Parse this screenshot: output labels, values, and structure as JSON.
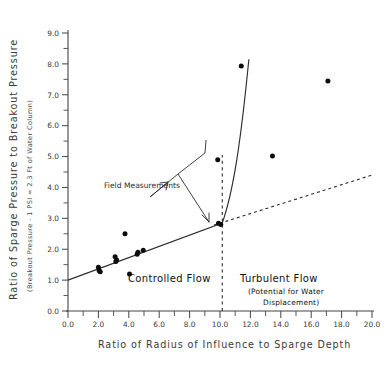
{
  "chart_data": {
    "type": "scatter",
    "title": "",
    "xlabel": "Ratio of Radius of Influence to Sparge Depth",
    "ylabel": "Ratio of Sparge Pressure to Breakout Pressure",
    "ylabel_sub": "(Breakout Pressure - 1 PSI = 2.3 Ft of Water Column)",
    "xlim": [
      0.0,
      20.0
    ],
    "ylim": [
      0.0,
      9.0
    ],
    "xticks": [
      "0.0",
      "2.0",
      "4.0",
      "6.0",
      "8.0",
      "10.0",
      "12.0",
      "14.0",
      "16.0",
      "18.0",
      "20.0"
    ],
    "xtick_values": [
      0,
      2,
      4,
      6,
      8,
      10,
      12,
      14,
      16,
      18,
      20
    ],
    "xtick_minor_step": 1.0,
    "yticks": [
      "0.0",
      "1.0",
      "2.0",
      "3.0",
      "4.0",
      "5.0",
      "6.0",
      "7.0",
      "8.0",
      "9.0"
    ],
    "ytick_values": [
      0,
      1,
      2,
      3,
      4,
      5,
      6,
      7,
      8,
      9
    ],
    "ytick_minor_step": 0.5,
    "grid": false,
    "legend": "none",
    "series": [
      {
        "name": "Field Measurements",
        "marker": "filled-circle",
        "points": [
          {
            "x": 2.0,
            "y": 1.42
          },
          {
            "x": 2.05,
            "y": 1.3
          },
          {
            "x": 2.12,
            "y": 1.27
          },
          {
            "x": 3.1,
            "y": 1.76
          },
          {
            "x": 3.15,
            "y": 1.6
          },
          {
            "x": 3.2,
            "y": 1.65
          },
          {
            "x": 3.75,
            "y": 2.5
          },
          {
            "x": 4.05,
            "y": 1.2
          },
          {
            "x": 4.55,
            "y": 1.84
          },
          {
            "x": 4.6,
            "y": 1.9
          },
          {
            "x": 4.95,
            "y": 1.97
          },
          {
            "x": 9.85,
            "y": 4.9
          },
          {
            "x": 9.9,
            "y": 2.84
          },
          {
            "x": 10.05,
            "y": 2.8
          },
          {
            "x": 11.4,
            "y": 7.93
          },
          {
            "x": 13.45,
            "y": 5.02
          },
          {
            "x": 17.1,
            "y": 7.45
          }
        ]
      }
    ],
    "trend_line": {
      "style": "solid",
      "description": "Linear controlled-flow trend rising into a steep turbulent-flow curve",
      "linear_from": {
        "x": 0.0,
        "y": 1.0
      },
      "linear_to": {
        "x": 10.15,
        "y": 2.85
      },
      "curve_to": {
        "x": 11.9,
        "y": 8.15
      }
    },
    "dotted_extension": {
      "style": "dotted",
      "from": {
        "x": 9.6,
        "y": 2.78
      },
      "to": {
        "x": 20.0,
        "y": 4.4
      }
    },
    "divider": {
      "style": "dashed-vertical",
      "x": 10.15,
      "y_from": 0.0,
      "y_to": 5.05
    },
    "annotations": [
      {
        "id": "field-measurements",
        "text": "Field Measurements",
        "arrows": 2
      },
      {
        "id": "controlled-flow",
        "text": "Controlled Flow"
      },
      {
        "id": "turbulent-flow",
        "text": "Turbulent Flow"
      },
      {
        "id": "turbulent-flow-sub-1",
        "text": "(Potential for Water"
      },
      {
        "id": "turbulent-flow-sub-2",
        "text": "Displacement)"
      }
    ],
    "colors": {
      "axis": "#444444",
      "marker": "#0c0c0c",
      "trend": "#2d2d2d",
      "background": "#ffffff"
    }
  },
  "axis": {
    "x_title": "Ratio of Radius of Influence to Sparge Depth",
    "y_title": "Ratio of Sparge Pressure to Breakout Pressure",
    "y_subtitle": "(Breakout Pressure - 1 PSI = 2.3 Ft of Water Column)"
  },
  "labels": {
    "field_measurements": "Field Measurements",
    "controlled_flow": "Controlled Flow",
    "turbulent_flow": "Turbulent Flow",
    "turbulent_sub_1": "(Potential for Water",
    "turbulent_sub_2": "Displacement)"
  },
  "xticklabels": [
    "0.0",
    "2.0",
    "4.0",
    "6.0",
    "8.0",
    "10.0",
    "12.0",
    "14.0",
    "16.0",
    "18.0",
    "20.0"
  ],
  "yticklabels": [
    "0.0",
    "1.0",
    "2.0",
    "3.0",
    "4.0",
    "5.0",
    "6.0",
    "7.0",
    "8.0",
    "9.0"
  ]
}
